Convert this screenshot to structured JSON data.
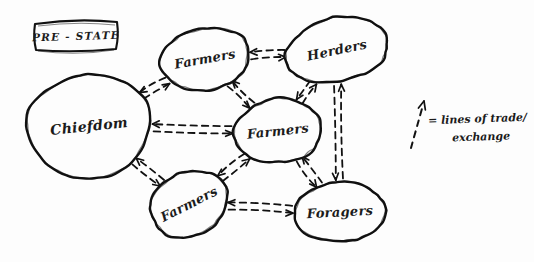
{
  "diagram": {
    "title_tag": "PRE - STATE",
    "nodes": [
      {
        "id": "chiefdom",
        "label": "Chiefdom",
        "cx": 89,
        "cy": 126,
        "rx": 62,
        "ry": 52,
        "rot": -6,
        "font": 14
      },
      {
        "id": "farmers-top",
        "label": "Farmers",
        "cx": 205,
        "cy": 59,
        "rx": 45,
        "ry": 31,
        "rot": -10,
        "font": 13
      },
      {
        "id": "herders",
        "label": "Herders",
        "cx": 337,
        "cy": 50,
        "rx": 52,
        "ry": 32,
        "rot": -12,
        "font": 13
      },
      {
        "id": "farmers-mid",
        "label": "Farmers",
        "cx": 278,
        "cy": 131,
        "rx": 44,
        "ry": 32,
        "rot": -6,
        "font": 13
      },
      {
        "id": "farmers-low",
        "label": "Farmers",
        "cx": 189,
        "cy": 204,
        "rx": 40,
        "ry": 32,
        "rot": -27,
        "font": 13
      },
      {
        "id": "foragers",
        "label": "Foragers",
        "cx": 340,
        "cy": 212,
        "rx": 46,
        "ry": 30,
        "rot": -3,
        "font": 13
      }
    ],
    "links": [
      {
        "from": "chiefdom",
        "to": "farmers-top",
        "name": "chiefdom-farmers-top"
      },
      {
        "from": "chiefdom",
        "to": "farmers-mid",
        "name": "chiefdom-farmers-mid"
      },
      {
        "from": "chiefdom",
        "to": "farmers-low",
        "name": "chiefdom-farmers-low"
      },
      {
        "from": "farmers-top",
        "to": "herders",
        "name": "farmers-top-herders"
      },
      {
        "from": "farmers-top",
        "to": "farmers-mid",
        "name": "farmers-top-farmers-mid"
      },
      {
        "from": "herders",
        "to": "farmers-mid",
        "name": "herders-farmers-mid"
      },
      {
        "from": "herders",
        "to": "foragers",
        "name": "herders-foragers"
      },
      {
        "from": "farmers-mid",
        "to": "farmers-low",
        "name": "farmers-mid-farmers-low"
      },
      {
        "from": "farmers-mid",
        "to": "foragers",
        "name": "farmers-mid-foragers"
      },
      {
        "from": "farmers-low",
        "to": "foragers",
        "name": "farmers-low-foragers"
      }
    ],
    "legend": {
      "line1": "= lines of trade/",
      "line2": "exchange",
      "symbol": "dashed-arrow-up"
    },
    "style": {
      "ink": "#111111",
      "paper": "#fdfdfd"
    }
  }
}
